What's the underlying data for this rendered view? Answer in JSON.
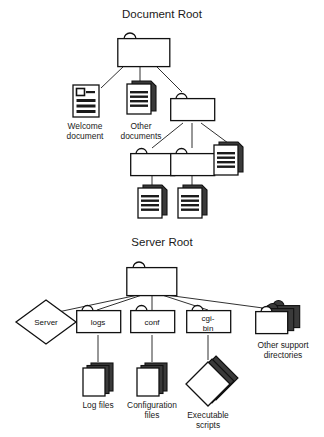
{
  "figure": {
    "background": "#ffffff",
    "ink": "#1a1a1a",
    "sections": [
      {
        "id": "document-root",
        "title": "Document Root",
        "nodes": [
          {
            "id": "doc-root-folder",
            "kind": "folder",
            "label": ""
          },
          {
            "id": "welcome-document",
            "kind": "document-single",
            "label": "Welcome\ndocument",
            "label_lines": [
              "Welcome",
              "document"
            ]
          },
          {
            "id": "other-documents",
            "kind": "document-stack",
            "label_lines": [
              "Other",
              "documents"
            ]
          },
          {
            "id": "subfolder-a",
            "kind": "folder",
            "label": ""
          },
          {
            "id": "subfolder-b",
            "kind": "folder",
            "label": ""
          },
          {
            "id": "subfolder-c",
            "kind": "folder",
            "label": ""
          },
          {
            "id": "document-right",
            "kind": "document-stack",
            "label": ""
          },
          {
            "id": "document-under-b",
            "kind": "document-stack",
            "label": ""
          },
          {
            "id": "document-under-c",
            "kind": "document-stack",
            "label": ""
          }
        ]
      },
      {
        "id": "server-root",
        "title": "Server Root",
        "nodes": [
          {
            "id": "server-root-folder",
            "kind": "folder",
            "label": ""
          },
          {
            "id": "server-binary",
            "kind": "diamond",
            "label": "Server"
          },
          {
            "id": "logs-folder",
            "kind": "folder-labeled",
            "label": "logs"
          },
          {
            "id": "conf-folder",
            "kind": "folder-labeled",
            "label": "conf"
          },
          {
            "id": "cgi-bin-folder",
            "kind": "folder-labeled",
            "label_lines": [
              "cgi-",
              "bin"
            ]
          },
          {
            "id": "other-support-directories",
            "kind": "folder-stack",
            "label_lines": [
              "Other support",
              "directories"
            ]
          },
          {
            "id": "log-files",
            "kind": "blank-document-stack",
            "label_lines": [
              "Log files"
            ]
          },
          {
            "id": "configuration-files",
            "kind": "blank-document-stack",
            "label_lines": [
              "Configuration",
              "files"
            ]
          },
          {
            "id": "executable-scripts",
            "kind": "diamond-stack",
            "label_lines": [
              "Executable",
              "scripts"
            ]
          }
        ]
      }
    ]
  },
  "labels": {
    "document_root_title": "Document Root",
    "server_root_title": "Server Root",
    "welcome_l1": "Welcome",
    "welcome_l2": "document",
    "other_docs_l1": "Other",
    "other_docs_l2": "documents",
    "server_diamond": "Server",
    "logs": "logs",
    "conf": "conf",
    "cgi_l1": "cgi-",
    "cgi_l2": "bin",
    "other_support_l1": "Other support",
    "other_support_l2": "directories",
    "log_files": "Log files",
    "config_l1": "Configuration",
    "config_l2": "files",
    "exec_l1": "Executable",
    "exec_l2": "scripts"
  }
}
